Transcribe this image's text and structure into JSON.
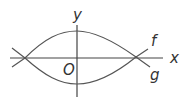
{
  "diagram": {
    "labels": {
      "y_axis": "y",
      "x_axis": "x",
      "origin": "O",
      "curve_upper": "f",
      "curve_lower": "g"
    },
    "colors": {
      "stroke": "#555555",
      "text": "#333333",
      "background": "#ffffff"
    }
  }
}
